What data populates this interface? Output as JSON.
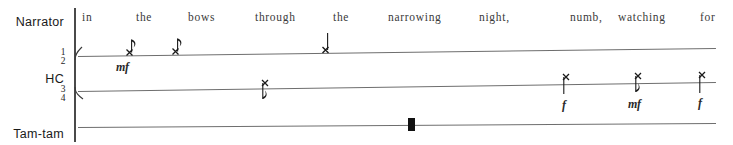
{
  "score": {
    "width": 733,
    "height": 145,
    "background": "#ffffff",
    "staff_color": "#6e6e6e",
    "ink_color": "#1a1a1a"
  },
  "parts": [
    {
      "id": "narrator",
      "label": "Narrator"
    },
    {
      "id": "hc",
      "label": "HC"
    },
    {
      "id": "tamtam",
      "label": "Tam-tam"
    }
  ],
  "lyrics": [
    {
      "text": "in",
      "x": 82
    },
    {
      "text": "the",
      "x": 136
    },
    {
      "text": "bows",
      "x": 188
    },
    {
      "text": "through",
      "x": 255
    },
    {
      "text": "the",
      "x": 333
    },
    {
      "text": "narrowing",
      "x": 388
    },
    {
      "text": "night,",
      "x": 479
    },
    {
      "text": "numb,",
      "x": 570
    },
    {
      "text": "watching",
      "x": 618
    },
    {
      "text": "for",
      "x": 700
    }
  ],
  "time_signatures": [
    {
      "numerator": "1",
      "denominator": "2",
      "staff": 1
    },
    {
      "numerator": "3",
      "denominator": "4",
      "staff": 2
    }
  ],
  "notes": [
    {
      "id": "n1",
      "staff": 1,
      "x": 125,
      "y": 48,
      "head": "x-notehead",
      "duration": "eighth",
      "stem": "up",
      "flag": true
    },
    {
      "id": "n2",
      "staff": 1,
      "x": 171,
      "y": 47,
      "head": "x-notehead",
      "duration": "eighth",
      "stem": "up",
      "flag": true
    },
    {
      "id": "n3",
      "staff": 1,
      "x": 325,
      "y": 41,
      "head": "x-notehead",
      "duration": "quarter",
      "stem": "up",
      "flag": false
    },
    {
      "id": "n4",
      "staff": 2,
      "x": 265,
      "y": 81,
      "head": "x-notehead",
      "duration": "eighth",
      "stem": "down",
      "flag": true
    },
    {
      "id": "n5",
      "staff": 2,
      "x": 565,
      "y": 76,
      "head": "x-notehead",
      "duration": "quarter",
      "stem": "down",
      "flag": false
    },
    {
      "id": "n6",
      "staff": 2,
      "x": 637,
      "y": 75,
      "head": "x-notehead",
      "duration": "eighth",
      "stem": "down",
      "flag": true
    },
    {
      "id": "n7",
      "staff": 2,
      "x": 701,
      "y": 74,
      "head": "x-notehead",
      "duration": "quarter",
      "stem": "down",
      "flag": false
    }
  ],
  "tam_tam_hit": {
    "id": "tam1",
    "x": 408,
    "y": 118,
    "head": "thick-bar-notehead"
  },
  "dynamics": [
    {
      "text": "mf",
      "x": 116,
      "y": 60
    },
    {
      "text": "f",
      "x": 562,
      "y": 98
    },
    {
      "text": "mf",
      "x": 628,
      "y": 97
    },
    {
      "text": "f",
      "x": 698,
      "y": 96
    }
  ]
}
